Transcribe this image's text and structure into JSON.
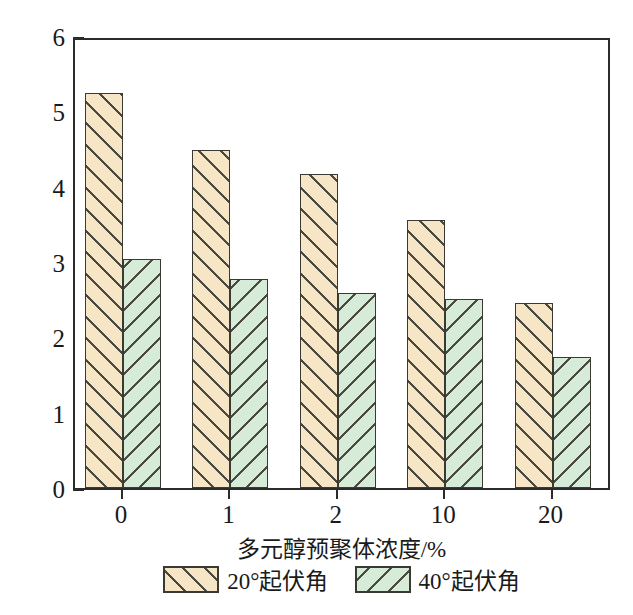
{
  "chart_data": {
    "type": "bar",
    "title": "",
    "xlabel": "多元醇预聚体浓度/%",
    "ylabel": "峰值滑动速度/(cm/s)",
    "categories": [
      "0",
      "1",
      "2",
      "10",
      "20"
    ],
    "series": [
      {
        "name": "20°起伏角",
        "values": [
          5.24,
          4.49,
          4.17,
          3.56,
          2.46
        ],
        "color": "#f7e6c6",
        "hatch": "forward-slash"
      },
      {
        "name": "40°起伏角",
        "values": [
          3.04,
          2.78,
          2.59,
          2.51,
          1.74
        ],
        "color": "#d6ecd9",
        "hatch": "back-slash"
      }
    ],
    "ylim": [
      0,
      6
    ],
    "ytick_labels": [
      "0",
      "1",
      "2",
      "3",
      "4",
      "5",
      "6"
    ],
    "ytick_values": [
      0,
      1,
      2,
      3,
      4,
      5,
      6
    ],
    "yminor_step": 0.5,
    "grid": false,
    "legend_position": "below-axes"
  },
  "axes": {
    "frame_color": "#2b2b2b",
    "background": "#ffffff"
  },
  "legend": {
    "items": [
      {
        "label": "20°起伏角",
        "swatch": "series-a-swatch"
      },
      {
        "label": "40°起伏角",
        "swatch": "series-b-swatch"
      }
    ]
  }
}
